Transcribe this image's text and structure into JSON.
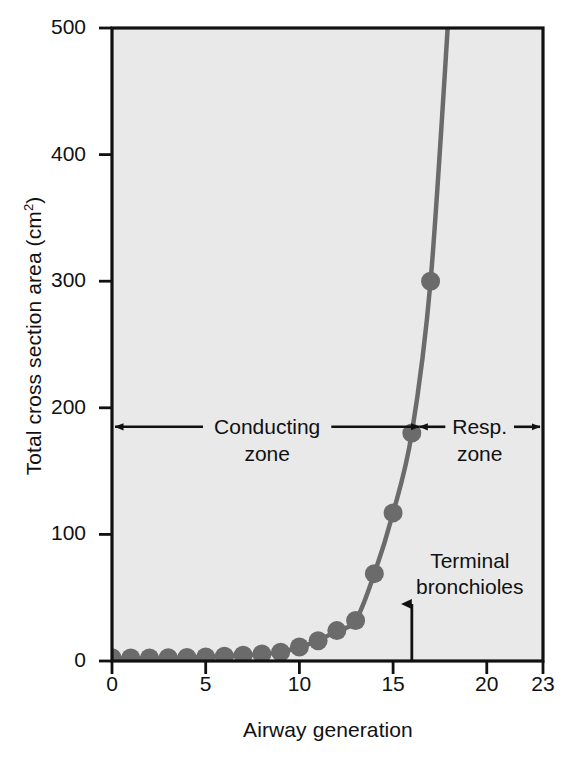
{
  "chart_data": {
    "type": "line",
    "title": "",
    "xlabel": "Airway generation",
    "ylabel": "Total cross section area (cm2)",
    "ylabel_text": "Total cross section area (cm",
    "ylabel_sup": "2",
    "ylabel_tail": ")",
    "xlim": [
      0,
      23
    ],
    "ylim": [
      0,
      500
    ],
    "grid": false,
    "legend": "none",
    "marker": "filled-circle",
    "series_color": "#6b6b6b",
    "plot_background": "#e9e9e9",
    "axis_color": "#111111",
    "xticks": [
      {
        "value": 0,
        "label": "0"
      },
      {
        "value": 5,
        "label": "5"
      },
      {
        "value": 10,
        "label": "10"
      },
      {
        "value": 15,
        "label": "15"
      },
      {
        "value": 20,
        "label": "20"
      },
      {
        "value": 23,
        "label": "23"
      }
    ],
    "yticks": [
      {
        "value": 0,
        "label": "0"
      },
      {
        "value": 100,
        "label": "100"
      },
      {
        "value": 200,
        "label": "200"
      },
      {
        "value": 300,
        "label": "300"
      },
      {
        "value": 400,
        "label": "400"
      },
      {
        "value": 500,
        "label": "500"
      }
    ],
    "x": [
      0,
      1,
      2,
      3,
      4,
      5,
      6,
      7,
      8,
      9,
      10,
      11,
      12,
      13,
      14,
      15,
      16,
      17,
      18
    ],
    "values": [
      2.5,
      2.3,
      2.3,
      2.5,
      2.8,
      3.2,
      3.8,
      4.5,
      5.5,
      7.0,
      11.0,
      16.0,
      24.0,
      32.0,
      69.0,
      117.0,
      180.0,
      300.0,
      520.0
    ],
    "series": [
      {
        "name": "Total cross section area",
        "values": [
          2.5,
          2.3,
          2.3,
          2.5,
          2.8,
          3.2,
          3.8,
          4.5,
          5.5,
          7.0,
          11.0,
          16.0,
          24.0,
          32.0,
          69.0,
          117.0,
          180.0,
          300.0,
          520.0
        ]
      }
    ],
    "annotations": [
      {
        "id": "conducting-zone",
        "text_line1": "Conducting",
        "text_line2": "zone",
        "arrow": "double-headed-horizontal",
        "x_start": 0,
        "x_end": 16.4,
        "y": 185
      },
      {
        "id": "resp-zone",
        "text_line1": "Resp.",
        "text_line2": "zone",
        "arrow": "double-headed-horizontal",
        "x_start": 16.4,
        "x_end": 23,
        "y": 185
      },
      {
        "id": "terminal-bronchioles",
        "text_line1": "Terminal",
        "text_line2": "bronchioles",
        "arrow": "up",
        "x": 16,
        "y_from": 0,
        "y_to": 45
      }
    ]
  }
}
